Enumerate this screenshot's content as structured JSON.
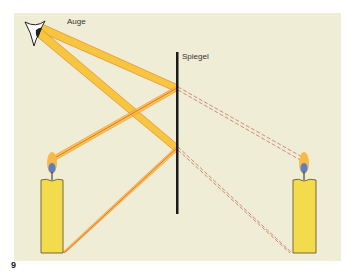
{
  "labels": {
    "eye": "Auge",
    "mirror": "Spiegel",
    "figure_number": "9"
  },
  "colors": {
    "background": "#efedd6",
    "beam_fill": "#f7c43a",
    "beam_edge": "#ef8a2a",
    "ray_line": "#e8503a",
    "virtual_ray": "#c8806a",
    "candle_body": "#f2dc4e",
    "mirror": "#1a1a1a",
    "flame_outer": "#f6b94a",
    "flame_inner": "#5b7fc2"
  }
}
